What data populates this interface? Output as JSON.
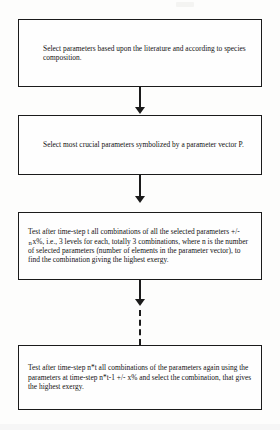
{
  "diagram": {
    "type": "flowchart",
    "orientation": "vertical",
    "node_count": 4,
    "nodes": [
      {
        "id": "node-1",
        "step": 1,
        "text": "Select parameters based upon the literature and according to species composition."
      },
      {
        "id": "node-2",
        "step": 2,
        "text": "Select most crucial parameters symbolized by a parameter vector P."
      },
      {
        "id": "node-3",
        "step": 3,
        "text_part_1": "Test after time-step t all combinations of all the selected parameters +/-",
        "subscript": "n",
        "text_part_2": "x%, i.e., 3 levels for each, totally 3 combinations, where n is the number of selected parameters (number of elements in the parameter vector), to find the combination giving the highest exergy."
      },
      {
        "id": "node-4",
        "step": 4,
        "text": "Test after time-step n*t all combinations of the parameters again using the parameters at time-step n*t-1 +/- x% and select the combination, that gives the highest exergy."
      }
    ],
    "connectors": [
      {
        "id": "conn-1",
        "from": "node-1",
        "to": "node-2",
        "style": "solid",
        "arrow": "down"
      },
      {
        "id": "conn-2",
        "from": "node-2",
        "to": "node-3",
        "style": "solid",
        "arrow": "down"
      },
      {
        "id": "conn-3",
        "from": "node-3",
        "to": "node-4",
        "style": "solid-then-dashed",
        "arrow": "down"
      }
    ],
    "colors": {
      "line": "#1b1b1b",
      "box_fill": "#fefefe",
      "text": "#121212",
      "page": "#fdfdfc"
    }
  }
}
